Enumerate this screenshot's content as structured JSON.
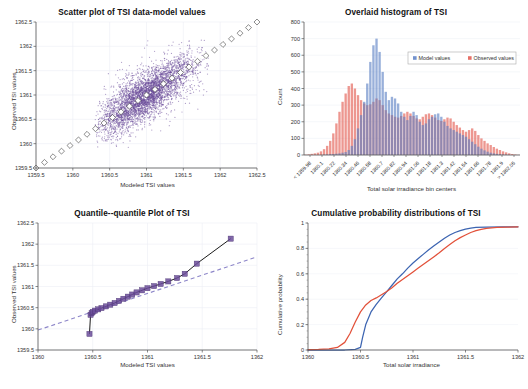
{
  "figure": {
    "caption_fragment": ""
  },
  "chart_data": [
    {
      "type": "scatter",
      "name": "scatter-tsi",
      "title": "Scatter plot of TSI data-model values",
      "xlabel": "Modeled TSI values",
      "ylabel": "Observed TSI values",
      "xlim": [
        1359.5,
        1362.5
      ],
      "ylim": [
        1359.5,
        1362.5
      ],
      "xticks": [
        "1359.5",
        "1360",
        "1360.5",
        "1361",
        "1361.5",
        "1362",
        "1362.5"
      ],
      "yticks": [
        "1359.5",
        "1360",
        "1360.5",
        "1361",
        "1361.5",
        "1362",
        "1362.5"
      ],
      "grid": true,
      "point_color": "#6B4C9A",
      "reference_line": {
        "label": "one-to-one line",
        "style": "dotted-white-with-open-square-markers",
        "from": [
          1359.5,
          1359.5
        ],
        "to": [
          1362.5,
          1362.5
        ],
        "marker_count": 27
      },
      "cloud": {
        "x_center": 1361.0,
        "y_center": 1361.0,
        "x_range": [
          1360.35,
          1361.8
        ],
        "y_range": [
          1359.95,
          1362.1
        ],
        "n_points_approx": 4000
      }
    },
    {
      "type": "bar",
      "name": "histogram-tsi",
      "title": "Overlaid histogram of TSI",
      "xlabel": "Total solar irradiance bin centers",
      "ylabel": "Count",
      "ylim": [
        0,
        800
      ],
      "yticks": [
        "0",
        "100",
        "200",
        "300",
        "400",
        "500",
        "600",
        "700",
        "800"
      ],
      "grid": true,
      "legend": {
        "position": "top-right-inside",
        "entries": [
          {
            "label": "Model values",
            "color": "#5B7FC4"
          },
          {
            "label": "Observed values",
            "color": "#E2574C"
          }
        ]
      },
      "categories": [
        "< 1359.98",
        "1360.1",
        "1360.22",
        "1360.34",
        "1360.46",
        "1360.58",
        "1360.7",
        "1360.82",
        "1360.94",
        "1361.06",
        "1361.18",
        "1361.3",
        "1361.42",
        "1361.54",
        "1361.66",
        "1361.78",
        "1361.9",
        "> 1362.05"
      ],
      "bin_step": 0.12,
      "series": [
        {
          "name": "Model values",
          "color": "#5B7FC4",
          "values": [
            0,
            0,
            0,
            0,
            0,
            0,
            2,
            3,
            5,
            6,
            8,
            10,
            14,
            18,
            30,
            55,
            95,
            160,
            240,
            320,
            430,
            560,
            660,
            700,
            620,
            500,
            380,
            330,
            350,
            340,
            310,
            260,
            230,
            210,
            235,
            260,
            240,
            200,
            180,
            190,
            215,
            230,
            245,
            250,
            230,
            200,
            175,
            160,
            150,
            140,
            130,
            120,
            110,
            95,
            80,
            65,
            50,
            38,
            28,
            20,
            14,
            10,
            7,
            5,
            3,
            2,
            1,
            0,
            0,
            0
          ]
        },
        {
          "name": "Observed values",
          "color": "#E2574C",
          "values": [
            2,
            4,
            7,
            10,
            14,
            22,
            35,
            55,
            85,
            130,
            190,
            260,
            320,
            370,
            415,
            430,
            400,
            360,
            330,
            310,
            300,
            305,
            320,
            340,
            330,
            300,
            270,
            250,
            240,
            230,
            225,
            235,
            250,
            260,
            250,
            235,
            220,
            215,
            230,
            245,
            250,
            240,
            225,
            210,
            205,
            215,
            225,
            220,
            200,
            180,
            165,
            150,
            140,
            150,
            160,
            145,
            120,
            100,
            85,
            70,
            60,
            48,
            38,
            30,
            22,
            16,
            10,
            6,
            3,
            1
          ]
        }
      ]
    },
    {
      "type": "line",
      "name": "qq-plot-tsi",
      "title": "Quantile--quantile Plot of TSI",
      "xlabel": "Modeled TSI values",
      "ylabel": "Observed TSI values",
      "xlim": [
        1360,
        1362
      ],
      "ylim": [
        1359.5,
        1362.5
      ],
      "xticks": [
        "1360",
        "1360.5",
        "1361",
        "1361.5",
        "1362"
      ],
      "yticks": [
        "1359.5",
        "1360",
        "1360.5",
        "1361",
        "1361.5",
        "1362",
        "1362.5"
      ],
      "grid": true,
      "marker_color": "#6B4C9A",
      "line_color": "#1a1a1a",
      "reference_line": {
        "style": "dashed",
        "color": "#8d86c9",
        "from": [
          1360,
          1359.97
        ],
        "to": [
          1362,
          1361.7
        ]
      },
      "points": [
        [
          1360.47,
          1359.88
        ],
        [
          1360.48,
          1360.33
        ],
        [
          1360.49,
          1360.37
        ],
        [
          1360.5,
          1360.4
        ],
        [
          1360.52,
          1360.43
        ],
        [
          1360.55,
          1360.46
        ],
        [
          1360.58,
          1360.49
        ],
        [
          1360.62,
          1360.53
        ],
        [
          1360.66,
          1360.57
        ],
        [
          1360.7,
          1360.61
        ],
        [
          1360.74,
          1360.66
        ],
        [
          1360.78,
          1360.71
        ],
        [
          1360.82,
          1360.76
        ],
        [
          1360.86,
          1360.81
        ],
        [
          1360.9,
          1360.86
        ],
        [
          1360.95,
          1360.91
        ],
        [
          1361.0,
          1360.96
        ],
        [
          1361.06,
          1361.01
        ],
        [
          1361.12,
          1361.06
        ],
        [
          1361.19,
          1361.12
        ],
        [
          1361.27,
          1361.2
        ],
        [
          1361.34,
          1361.3
        ],
        [
          1361.45,
          1361.54
        ],
        [
          1361.76,
          1362.13
        ]
      ]
    },
    {
      "type": "line",
      "name": "cdf-tsi",
      "title": "Cumulative probability distributions of TSI",
      "xlabel": "Total solar irradiance",
      "ylabel": "Cumulative probability",
      "xlim": [
        1360,
        1362
      ],
      "ylim": [
        0,
        1
      ],
      "xticks": [
        "1360",
        "1360.5",
        "1361",
        "1361.5",
        "1362"
      ],
      "yticks": [
        "0",
        "0.2",
        "0.4",
        "0.6",
        "0.8",
        "1"
      ],
      "grid": true,
      "series": [
        {
          "name": "Model values",
          "color": "#3C64B1",
          "points": [
            [
              1360,
              0
            ],
            [
              1360.2,
              0
            ],
            [
              1360.35,
              0
            ],
            [
              1360.45,
              0.005
            ],
            [
              1360.5,
              0.02
            ],
            [
              1360.52,
              0.1
            ],
            [
              1360.55,
              0.2
            ],
            [
              1360.6,
              0.3
            ],
            [
              1360.65,
              0.36
            ],
            [
              1360.7,
              0.41
            ],
            [
              1360.75,
              0.46
            ],
            [
              1360.8,
              0.51
            ],
            [
              1360.85,
              0.56
            ],
            [
              1360.9,
              0.6
            ],
            [
              1360.95,
              0.645
            ],
            [
              1361,
              0.685
            ],
            [
              1361.05,
              0.72
            ],
            [
              1361.1,
              0.755
            ],
            [
              1361.15,
              0.79
            ],
            [
              1361.2,
              0.82
            ],
            [
              1361.25,
              0.85
            ],
            [
              1361.3,
              0.88
            ],
            [
              1361.35,
              0.905
            ],
            [
              1361.4,
              0.925
            ],
            [
              1361.45,
              0.94
            ],
            [
              1361.5,
              0.952
            ],
            [
              1361.55,
              0.96
            ],
            [
              1361.6,
              0.965
            ],
            [
              1361.7,
              0.968
            ],
            [
              1361.85,
              0.97
            ],
            [
              1362,
              0.97
            ]
          ]
        },
        {
          "name": "Observed values",
          "color": "#E2513A",
          "points": [
            [
              1360,
              0.003
            ],
            [
              1360.1,
              0.004
            ],
            [
              1360.2,
              0.008
            ],
            [
              1360.28,
              0.02
            ],
            [
              1360.35,
              0.06
            ],
            [
              1360.4,
              0.13
            ],
            [
              1360.45,
              0.22
            ],
            [
              1360.5,
              0.3
            ],
            [
              1360.55,
              0.355
            ],
            [
              1360.6,
              0.39
            ],
            [
              1360.65,
              0.41
            ],
            [
              1360.7,
              0.435
            ],
            [
              1360.75,
              0.46
            ],
            [
              1360.8,
              0.49
            ],
            [
              1360.85,
              0.525
            ],
            [
              1360.9,
              0.555
            ],
            [
              1360.95,
              0.585
            ],
            [
              1361,
              0.615
            ],
            [
              1361.05,
              0.645
            ],
            [
              1361.1,
              0.675
            ],
            [
              1361.15,
              0.705
            ],
            [
              1361.2,
              0.735
            ],
            [
              1361.25,
              0.765
            ],
            [
              1361.3,
              0.8
            ],
            [
              1361.35,
              0.83
            ],
            [
              1361.4,
              0.86
            ],
            [
              1361.45,
              0.885
            ],
            [
              1361.5,
              0.905
            ],
            [
              1361.55,
              0.925
            ],
            [
              1361.6,
              0.94
            ],
            [
              1361.65,
              0.95
            ],
            [
              1361.7,
              0.958
            ],
            [
              1361.8,
              0.965
            ],
            [
              1361.9,
              0.968
            ],
            [
              1362,
              0.97
            ]
          ]
        }
      ]
    }
  ]
}
